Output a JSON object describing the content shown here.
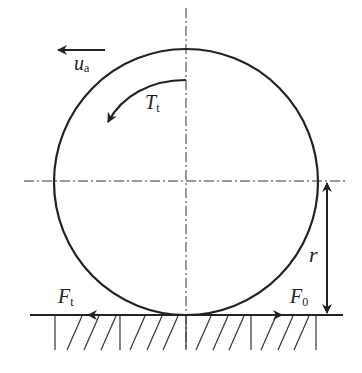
{
  "diagram": {
    "type": "wheel-ground-contact",
    "labels": {
      "velocity": {
        "main": "u",
        "sub": "a"
      },
      "torque": {
        "main": "T",
        "sub": "t"
      },
      "traction_force": {
        "main": "F",
        "sub": "t"
      },
      "rolling_force": {
        "main": "F",
        "sub": "0"
      },
      "radius": "r"
    },
    "colors": {
      "stroke": "#222222",
      "background": "#ffffff"
    }
  }
}
